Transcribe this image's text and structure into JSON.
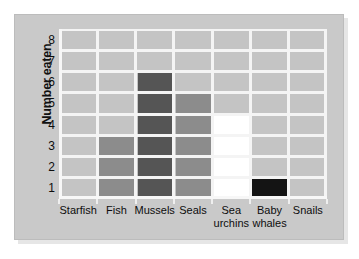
{
  "chart_data": {
    "type": "bar",
    "title": "",
    "subtitle": "",
    "xlabel": "",
    "ylabel": "Number eaten",
    "categories": [
      "Starfish",
      "Fish",
      "Mussels",
      "Seals",
      "Sea urchins",
      "Baby whales",
      "Snails"
    ],
    "values": [
      0,
      3,
      6,
      5,
      4,
      1,
      0
    ],
    "bar_colors": [
      "#c4c4c4",
      "#8c8c8c",
      "#555555",
      "#8c8c8c",
      "#ffffff",
      "#141414",
      "#c4c4c4"
    ],
    "ylim": [
      0,
      8
    ],
    "ytick_labels": [
      "1",
      "2",
      "3",
      "4",
      "5",
      "6",
      "7",
      "8"
    ],
    "ytick_values": [
      1,
      2,
      3,
      4,
      5,
      6,
      7,
      8
    ],
    "grid": true,
    "grid_color": "#f4f4f4",
    "plot_background": "#c4c4c4",
    "legend": "none"
  },
  "axis": {
    "y_title": "Number eaten"
  },
  "x_labels": [
    {
      "line1": "Starfish",
      "line2": ""
    },
    {
      "line1": "Fish",
      "line2": ""
    },
    {
      "line1": "Mussels",
      "line2": ""
    },
    {
      "line1": "Seals",
      "line2": ""
    },
    {
      "line1": "Sea",
      "line2": "urchins"
    },
    {
      "line1": "Baby",
      "line2": "whales"
    },
    {
      "line1": "Snails",
      "line2": ""
    }
  ],
  "colors": {
    "card_background": "#c9c9c9",
    "page_background": "#ffffff",
    "grid": "#f4f4f4",
    "text": "#0d0d0d"
  }
}
